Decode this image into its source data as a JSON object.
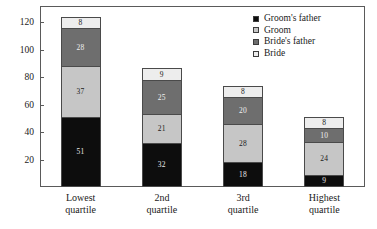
{
  "chart_data": {
    "type": "bar",
    "subtype": "stacked-bar",
    "title": "",
    "xlabel": "",
    "ylabel": "",
    "ylim": [
      0,
      132
    ],
    "yticks": [
      20,
      40,
      60,
      80,
      100,
      120
    ],
    "grid": false,
    "legend_position": "top-right",
    "categories": [
      "Lowest quartile",
      "2nd quartile",
      "3rd quartile",
      "Highest quartile"
    ],
    "category_lines": [
      [
        "Lowest",
        "quartile"
      ],
      [
        "2nd",
        "quartile"
      ],
      [
        "3rd",
        "quartile"
      ],
      [
        "Highest",
        "quartile"
      ]
    ],
    "series": [
      {
        "name": "Groom's father",
        "key": "grooms-father",
        "color": "#0d0d0d",
        "values": [
          51,
          32,
          18,
          9
        ]
      },
      {
        "name": "Groom",
        "key": "groom",
        "color": "#c6c6c6",
        "values": [
          37,
          21,
          28,
          24
        ]
      },
      {
        "name": "Bride's father",
        "key": "brides-father",
        "color": "#6e6e6e",
        "values": [
          28,
          25,
          20,
          10
        ]
      },
      {
        "name": "Bride",
        "key": "bride",
        "color": "#ededed",
        "values": [
          8,
          9,
          8,
          8
        ]
      }
    ],
    "totals": [
      124,
      87,
      74,
      51
    ],
    "legend": [
      {
        "label": "Groom's father",
        "key": "grooms-father",
        "color": "#0d0d0d"
      },
      {
        "label": "Groom",
        "key": "groom",
        "color": "#c6c6c6"
      },
      {
        "label": "Bride's father",
        "key": "brides-father",
        "color": "#6e6e6e"
      },
      {
        "label": "Bride",
        "key": "bride",
        "color": "#ededed"
      }
    ]
  }
}
